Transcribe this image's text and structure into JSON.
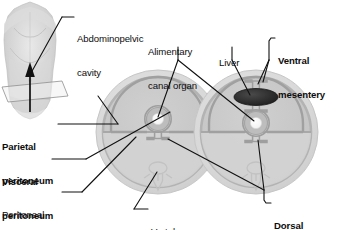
{
  "figure": {
    "type": "anatomical-diagram"
  },
  "colors": {
    "background": "#ffffff",
    "text": "#0d0d0d",
    "leader_line": "#111111",
    "body_wall_outer": "#d6d6d6",
    "body_wall_rim": "#b0b0b0",
    "cavity_fill": "#c9c9c9",
    "lower_fill": "#d2d2d2",
    "peritoneum_line": "#9a9a9a",
    "organ_ring": "#b8b8b8",
    "organ_lumen": "#fdfdfd",
    "liver_dark": "#2e2e2e",
    "vertebra_outline": "#c0c0c0",
    "torso_gray": "#cfcfcf"
  },
  "labels": {
    "abdominopelvic_cavity": {
      "text": "Abdominopelvic\ncavity",
      "line1": "Abdominopelvic",
      "line2": "cavity",
      "bold": false
    },
    "alimentary_canal_organ": {
      "line1": "Alimentary",
      "line2": "canal organ",
      "bold": false
    },
    "liver": {
      "line1": "Liver",
      "bold": false
    },
    "ventral_mesentery": {
      "line1": "Ventral",
      "line2": "mesentery",
      "bold": true
    },
    "parietal_peritoneum": {
      "line1": "Parietal",
      "line2": "peritoneum",
      "bold": true
    },
    "visceral_peritoneum": {
      "line1": "Visceral",
      "line2": "peritoneum",
      "bold": true
    },
    "peritoneal_cavity": {
      "line1": "Peritoneal",
      "line2": "cavity",
      "bold": false
    },
    "vertebra": {
      "line1": "Vertebra",
      "bold": false
    },
    "dorsal_mesentery": {
      "line1": "Dorsal",
      "line2": "mesentery",
      "bold": true
    }
  },
  "panels": {
    "torso": {
      "name": "human-torso-anterior-view",
      "plane_name": "transverse-section-plane",
      "arrow_name": "viewing-direction-arrow"
    },
    "left_section": {
      "name": "cross-section-simple-mesentery",
      "structures": [
        "body-wall",
        "parietal-peritoneum",
        "peritoneal-cavity",
        "alimentary-canal-organ",
        "visceral-peritoneum",
        "dorsal-mesentery",
        "vertebra"
      ]
    },
    "right_section": {
      "name": "cross-section-with-liver",
      "structures": [
        "body-wall",
        "parietal-peritoneum",
        "liver",
        "ventral-mesentery",
        "alimentary-canal-organ",
        "dorsal-mesentery",
        "vertebra"
      ]
    }
  }
}
